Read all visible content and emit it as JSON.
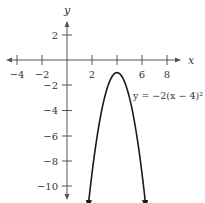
{
  "chart_data": {
    "type": "line",
    "title": "",
    "xlabel": "x",
    "ylabel": "y",
    "xlim": [
      -5,
      9
    ],
    "ylim": [
      -11,
      3.5
    ],
    "x_ticks": [
      -4,
      -2,
      2,
      4,
      6,
      8
    ],
    "x_tick_labels": [
      "-4",
      "-2",
      "2",
      "",
      "6",
      "8"
    ],
    "y_ticks": [
      2,
      -2,
      -4,
      -6,
      -8,
      -10
    ],
    "y_tick_labels": [
      "2",
      "-2",
      "-4",
      "-6",
      "-8",
      "-10"
    ],
    "grid": false,
    "series": [
      {
        "name": "y = -2(x - 4)^2 - 1",
        "equation": "y = -2(x - 4)² - 1",
        "vertex": [
          4,
          -1
        ],
        "opens": "down",
        "arrows_at_ends": true,
        "x": [
          1.7,
          2,
          2.5,
          3,
          3.5,
          4,
          4.5,
          5,
          5.5,
          6,
          6.3
        ],
        "y": [
          -11.58,
          -9,
          -5.5,
          -3,
          -1.5,
          -1,
          -1.5,
          -3,
          -5.5,
          -9,
          -11.58
        ]
      }
    ],
    "annotations": [
      {
        "text": "y = −2(x − 4)² − 1",
        "anchor_x": 6.3,
        "anchor_y": -2.3
      }
    ]
  },
  "labels": {
    "x_axis": "x",
    "y_axis": "y",
    "equation": "y = −2(x − 4)² − 1",
    "xt_m4": "−4",
    "xt_m2": "−2",
    "xt_2": "2",
    "xt_6": "6",
    "xt_8": "8",
    "yt_2": "2",
    "yt_m2": "−2",
    "yt_m4": "−4",
    "yt_m6": "−6",
    "yt_m8": "−8",
    "yt_m10": "−10"
  },
  "colors": {
    "axis": "#555555",
    "curve": "#1a1a1a",
    "text": "#333333"
  }
}
